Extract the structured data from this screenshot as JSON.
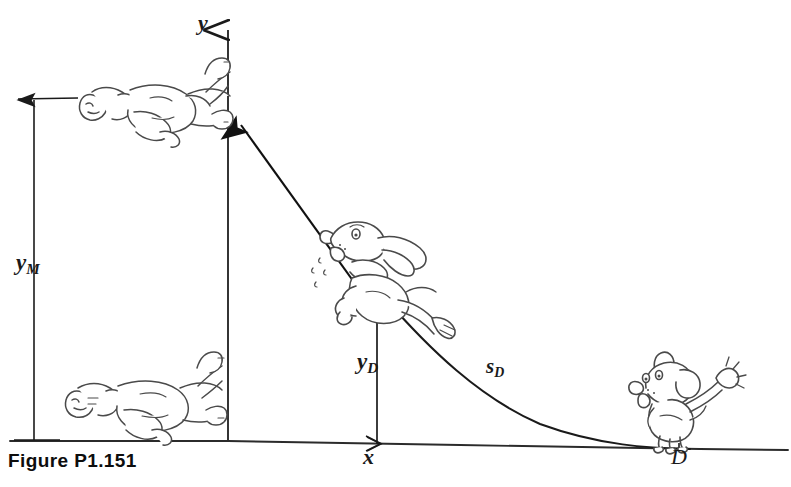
{
  "figure": {
    "caption": "Figure P1.151",
    "axes": {
      "y_axis_label": "y",
      "x_axis_label": "x"
    },
    "labels": {
      "y_max": {
        "base": "y",
        "subscript": "M"
      },
      "y_dog": {
        "base": "y",
        "subscript": "D"
      },
      "s_dog": {
        "base": "s",
        "subscript": "D"
      },
      "point_d": "D"
    },
    "illustrations": {
      "upper_person": "reclining-person-upper",
      "lower_person": "reclining-person-lower",
      "flying_dog": "flying-dog",
      "standing_dog": "standing-dog-waving"
    },
    "colors": {
      "ink": "#1a1a1a",
      "line": "#2b2b2b",
      "sketch": "#4a4a4a",
      "background": "#ffffff"
    }
  }
}
